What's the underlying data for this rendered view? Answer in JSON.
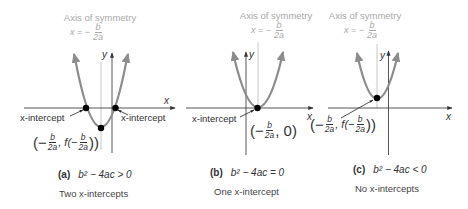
{
  "figure": {
    "colors": {
      "parabola": "#8c8c8c",
      "axis": "#444444",
      "axis_of_symmetry_line": "#c8c8c8",
      "axis_of_symmetry_text": "#a8a8a8",
      "point": "#000000",
      "text": "#333333"
    },
    "panels": [
      {
        "id": "a",
        "axis_of_symmetry": {
          "title": "Axis of symmetry",
          "eq_prefix": "x = −",
          "eq_num": "b",
          "eq_den": "2a"
        },
        "y_label": "y",
        "x_label": "x",
        "intercept_labels": [
          "x-intercept",
          "x-intercept"
        ],
        "vertex_label": {
          "open": "(−",
          "num1": "b",
          "den1": "2a",
          "mid": ", f(−",
          "num2": "b",
          "den2": "2a",
          "close": "))"
        },
        "caption_letter": "(a)",
        "caption_expr": "b² − 4ac > 0",
        "subcaption": "Two x-intercepts",
        "intercepts": 2
      },
      {
        "id": "b",
        "axis_of_symmetry": {
          "title": "Axis of symmetry",
          "eq_prefix": "x = −",
          "eq_num": "b",
          "eq_den": "2a"
        },
        "y_label": "y",
        "x_label": "x",
        "intercept_labels": [
          "x-intercept"
        ],
        "vertex_label": {
          "open": "(−",
          "num1": "b",
          "den1": "2a",
          "close": ", 0)"
        },
        "caption_letter": "(b)",
        "caption_expr": "b² − 4ac = 0",
        "subcaption": "One x-intercept",
        "intercepts": 1
      },
      {
        "id": "c",
        "axis_of_symmetry": {
          "title": "Axis of symmetry",
          "eq_prefix": "x = −",
          "eq_num": "b",
          "eq_den": "2a"
        },
        "y_label": "y",
        "x_label": "x",
        "intercept_labels": [],
        "vertex_label": {
          "open": "(−",
          "num1": "b",
          "den1": "2a",
          "mid": ", f(−",
          "num2": "b",
          "den2": "2a",
          "close": "))"
        },
        "caption_letter": "(c)",
        "caption_expr": "b² − 4ac < 0",
        "subcaption": "No x-intercepts",
        "intercepts": 0
      }
    ]
  }
}
